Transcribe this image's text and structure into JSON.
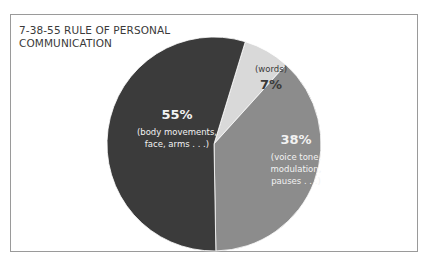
{
  "chart_data": {
    "type": "pie",
    "title": "7-38-55 RULE OF PERSONAL COMMUNICATION",
    "slices": [
      {
        "label": "(words)",
        "value": 7,
        "display": "7%",
        "color": "#d9d9d9"
      },
      {
        "label": "(voice tone, modulation, pauses . . .)",
        "value": 38,
        "display": "38%",
        "color": "#8c8c8c"
      },
      {
        "label": "(body movements, face, arms . . .)",
        "value": 55,
        "display": "55%",
        "color": "#3b3b3b"
      }
    ],
    "start_angle_deg": 17,
    "direction": "clockwise",
    "legend": "none"
  },
  "title_lines": [
    "7-38-55 RULE OF PERSONAL",
    "COMMUNICATION"
  ],
  "labels": {
    "words": {
      "pct": "7%",
      "desc": "(words)"
    },
    "voice": {
      "pct": "38%",
      "desc1": "(voice tone,",
      "desc2": "modulation,",
      "desc3": "pauses . . .)"
    },
    "body": {
      "pct": "55%",
      "desc1": "(body movements,",
      "desc2": "face, arms . . .)"
    }
  }
}
